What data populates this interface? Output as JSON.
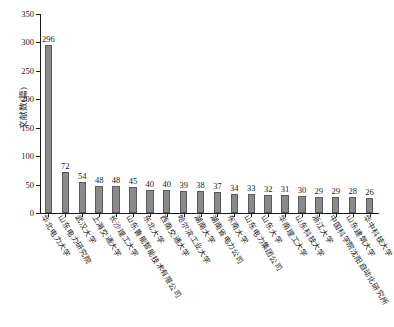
{
  "chart_data": {
    "type": "bar",
    "title": "",
    "subtitle": "",
    "xlabel": "",
    "ylabel": "文献数(篇)",
    "ylim": [
      0,
      350
    ],
    "ytick_step": 50,
    "yticks": [
      "0",
      "50",
      "100",
      "150",
      "200",
      "250",
      "300",
      "350"
    ],
    "grid": false,
    "legend": null,
    "bar_color": "#8a8a8a",
    "bar_border_color": "#5a5a5a",
    "axis_color": "#1a1a1a",
    "categories": [
      "华北电力大学",
      "山东电力研究院",
      "武汉大学",
      "上海交通大学",
      "长沙理工大学",
      "山东鲁能智能技术有限公司",
      "东北大学",
      "西南交通大学",
      "哈尔滨工业大学",
      "湖南大学",
      "湖南省电力公司",
      "东南大学",
      "山东电力集团公司",
      "山东大学",
      "华南理工大学",
      "山东科技大学",
      "浙江大学",
      "中国科学院沈阳自动化研究所",
      "山东建筑大学",
      "华中科技大学"
    ],
    "values": [
      296,
      72,
      54,
      48,
      48,
      45,
      40,
      40,
      39,
      38,
      37,
      34,
      33,
      32,
      31,
      30,
      29,
      29,
      28,
      26
    ],
    "data_labels": [
      "296",
      "72",
      "54",
      "48",
      "48",
      "45",
      "40",
      "40",
      "39",
      "38",
      "37",
      "34",
      "33",
      "32",
      "31",
      "30",
      "29",
      "29",
      "28",
      "26"
    ]
  }
}
